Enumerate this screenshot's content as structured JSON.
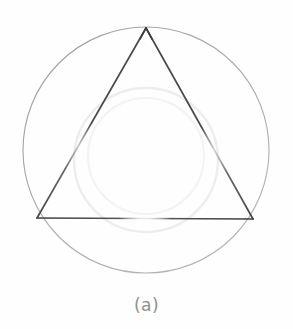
{
  "figure": {
    "caption": "(a)",
    "background_color": "#fefefe",
    "width": 293,
    "height": 329,
    "shapes": {
      "circle": {
        "name": "circumscribed-circle",
        "center_x": 146,
        "center_y": 150,
        "radius": 123,
        "stroke_color": "#a9a9a9",
        "stroke_width": 1,
        "fill": "none"
      },
      "triangle": {
        "name": "inscribed-triangle",
        "vertices": [
          {
            "label": "apex",
            "x": 146,
            "y": 28
          },
          {
            "label": "bottom-right",
            "x": 253,
            "y": 219
          },
          {
            "label": "bottom-left",
            "x": 37,
            "y": 218
          }
        ],
        "stroke_color": "#4f4f4f",
        "stroke_width": 1.6,
        "fill": "none"
      },
      "ghost_circle": {
        "name": "scan-ghost-circle",
        "center_x": 146,
        "center_y": 160,
        "radius": 72,
        "stroke_color": "#ededed",
        "stroke_width": 2,
        "fill": "none"
      }
    }
  }
}
